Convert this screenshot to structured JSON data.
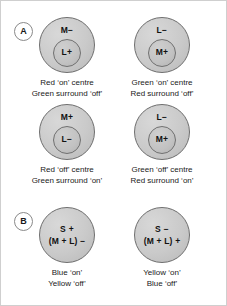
{
  "figure": {
    "background_color": "#ffffff",
    "border_color": "#cfcfcf",
    "field_fill_color": "#cacaca",
    "field_stroke_color": "#6e6e6e",
    "text_color": "#1a1a1a"
  },
  "panels": [
    {
      "id": "A",
      "badge_label": "A",
      "type": "single-opponent-concentric",
      "cells": [
        {
          "id": "a1",
          "surround_label": "M−",
          "centre_label": "L+",
          "caption_line1": "Red ‘on’ centre",
          "caption_line2": "Green surround ‘off’"
        },
        {
          "id": "a2",
          "surround_label": "L−",
          "centre_label": "M+",
          "caption_line1": "Green ‘on’ centre",
          "caption_line2": "Red surround ‘off’"
        },
        {
          "id": "a3",
          "surround_label": "M+",
          "centre_label": "L−",
          "caption_line1": "Red ‘off’ centre",
          "caption_line2": "Green surround ‘on’"
        },
        {
          "id": "a4",
          "surround_label": "L−",
          "centre_label": "M+",
          "caption_line1": "Green ‘off’ centre",
          "caption_line2": "Red surround ‘on’"
        }
      ]
    },
    {
      "id": "B",
      "badge_label": "B",
      "type": "co-extensive-blue-yellow",
      "cells": [
        {
          "id": "b1",
          "top_label": "S +",
          "bottom_label": "(M + L) −",
          "caption_line1": "Blue ‘on’",
          "caption_line2": "Yellow ‘off’"
        },
        {
          "id": "b2",
          "top_label": "S −",
          "bottom_label": "(M + L) +",
          "caption_line1": "Yellow ‘on’",
          "caption_line2": "Blue ‘off’"
        }
      ]
    }
  ]
}
